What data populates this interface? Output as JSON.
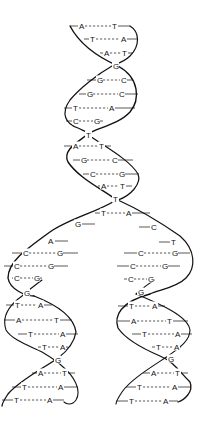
{
  "diagram": {
    "colors": {
      "strand": "#111111",
      "background": "#ffffff"
    },
    "parent_helix": {
      "pairs": [
        {
          "y": 26,
          "x1": 70,
          "x2": 130,
          "left": "A",
          "right": "T",
          "lx": 79,
          "rx": 112
        },
        {
          "y": 39,
          "x1": 84,
          "x2": 137,
          "left": "T",
          "right": "A",
          "lx": 90,
          "rx": 121
        },
        {
          "y": 53,
          "x1": 100,
          "x2": 133,
          "left": "A",
          "right": "T",
          "lx": 104,
          "rx": 122
        },
        {
          "y": 80,
          "x1": 87,
          "x2": 133,
          "left": "G",
          "right": "C",
          "lx": 97,
          "rx": 121
        },
        {
          "y": 94,
          "x1": 79,
          "x2": 138,
          "left": "G",
          "right": "C",
          "lx": 87,
          "rx": 119
        },
        {
          "y": 108,
          "x1": 64,
          "x2": 135,
          "left": "T",
          "right": "A",
          "lx": 73,
          "rx": 109
        },
        {
          "y": 121,
          "x1": 66,
          "x2": 103,
          "left": "C",
          "right": "G",
          "lx": 73,
          "rx": 94
        },
        {
          "y": 146,
          "x1": 64,
          "x2": 111,
          "left": "A",
          "right": "T",
          "lx": 73,
          "rx": 99
        },
        {
          "y": 160,
          "x1": 73,
          "x2": 133,
          "left": "G",
          "right": "C",
          "lx": 81,
          "rx": 112
        },
        {
          "y": 174,
          "x1": 83,
          "x2": 139,
          "left": "C",
          "right": "G",
          "lx": 90,
          "rx": 119
        },
        {
          "y": 186,
          "x1": 98,
          "x2": 132,
          "left": "A",
          "right": "T",
          "lx": 101,
          "rx": 120
        }
      ],
      "crossings": [
        {
          "label": "G",
          "x": 113,
          "y": 66
        },
        {
          "label": "T",
          "x": 86,
          "y": 135
        },
        {
          "label": "T",
          "x": 113,
          "y": 199
        }
      ],
      "fork_pair": {
        "y": 213,
        "x1": 95,
        "x2": 150,
        "left": "T",
        "right": "A",
        "lx": 101,
        "rx": 126
      }
    },
    "left_daughter": {
      "single_bases": [
        {
          "label": "G",
          "x": 75,
          "y": 224
        },
        {
          "label": "A",
          "x": 48,
          "y": 241
        }
      ],
      "pairs": [
        {
          "y": 253,
          "x1": 12,
          "x2": 78,
          "left": "C",
          "right": "G",
          "lx": 23,
          "rx": 57
        },
        {
          "y": 266,
          "x1": 4,
          "x2": 68,
          "left": "C",
          "right": "G",
          "lx": 14,
          "rx": 48
        },
        {
          "y": 278,
          "x1": 12,
          "x2": 42,
          "left": "C",
          "right": "G",
          "lx": 14,
          "rx": 34
        },
        {
          "y": 305,
          "x1": 6,
          "x2": 52,
          "left": "T",
          "right": "A",
          "lx": 15,
          "rx": 38
        },
        {
          "y": 320,
          "x1": 4,
          "x2": 72,
          "left": "A",
          "right": "T",
          "lx": 16,
          "rx": 54
        },
        {
          "y": 334,
          "x1": 18,
          "x2": 78,
          "left": "T",
          "right": "A",
          "lx": 28,
          "rx": 60
        },
        {
          "y": 347,
          "x1": 38,
          "x2": 68,
          "left": "T",
          "right": "A",
          "lx": 42,
          "rx": 60
        },
        {
          "y": 373,
          "x1": 32,
          "x2": 75,
          "left": "A",
          "right": "T",
          "lx": 38,
          "rx": 62
        },
        {
          "y": 387,
          "x1": 12,
          "x2": 78,
          "left": "T",
          "right": "A",
          "lx": 22,
          "rx": 58
        },
        {
          "y": 400,
          "x1": 2,
          "x2": 64,
          "left": "T",
          "right": "A",
          "lx": 14,
          "rx": 47
        }
      ],
      "crossings": [
        {
          "label": "G",
          "x": 24,
          "y": 293
        },
        {
          "label": "G",
          "x": 55,
          "y": 360
        }
      ]
    },
    "right_daughter": {
      "single_bases": [
        {
          "label": "C",
          "x": 151,
          "y": 227
        },
        {
          "label": "T",
          "x": 171,
          "y": 242
        }
      ],
      "pairs": [
        {
          "y": 253,
          "x1": 124,
          "x2": 190,
          "left": "C",
          "right": "G",
          "lx": 138,
          "rx": 172
        },
        {
          "y": 266,
          "x1": 117,
          "x2": 180,
          "left": "C",
          "right": "G",
          "lx": 130,
          "rx": 162
        },
        {
          "y": 279,
          "x1": 124,
          "x2": 154,
          "left": "C",
          "right": "G",
          "lx": 128,
          "rx": 148
        },
        {
          "y": 306,
          "x1": 118,
          "x2": 165,
          "left": "T",
          "right": "A",
          "lx": 129,
          "rx": 152
        },
        {
          "y": 321,
          "x1": 118,
          "x2": 188,
          "left": "A",
          "right": "T",
          "lx": 131,
          "rx": 167
        },
        {
          "y": 334,
          "x1": 132,
          "x2": 192,
          "left": "T",
          "right": "A",
          "lx": 142,
          "rx": 175
        },
        {
          "y": 347,
          "x1": 152,
          "x2": 181,
          "left": "T",
          "right": "A",
          "lx": 156,
          "rx": 174
        },
        {
          "y": 373,
          "x1": 143,
          "x2": 188,
          "left": "A",
          "right": "T",
          "lx": 151,
          "rx": 175
        },
        {
          "y": 387,
          "x1": 126,
          "x2": 191,
          "left": "T",
          "right": "A",
          "lx": 137,
          "rx": 172
        },
        {
          "y": 401,
          "x1": 116,
          "x2": 178,
          "left": "T",
          "right": "A",
          "lx": 129,
          "rx": 163
        }
      ],
      "crossings": [
        {
          "label": "G",
          "x": 138,
          "y": 292
        },
        {
          "label": "G",
          "x": 168,
          "y": 359
        }
      ]
    }
  }
}
